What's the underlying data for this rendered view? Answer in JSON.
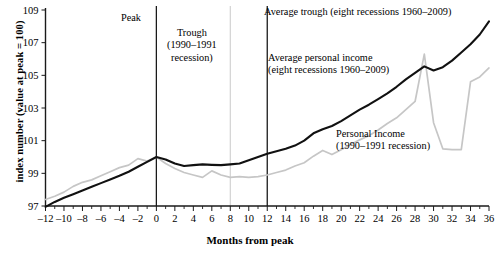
{
  "chart_data": {
    "type": "line",
    "title": "",
    "xlabel": "Months from peak",
    "ylabel": "index number (value at peak = 100)",
    "xlim": [
      -12,
      36
    ],
    "ylim": [
      97,
      109
    ],
    "grid": false,
    "legend_position": "inline-annotations",
    "x_ticks": [
      -12,
      -10,
      -8,
      -6,
      -4,
      -2,
      0,
      2,
      4,
      6,
      8,
      10,
      12,
      14,
      16,
      18,
      20,
      22,
      24,
      26,
      28,
      30,
      32,
      34,
      36
    ],
    "x_tick_labels": [
      "–12",
      "–10",
      "–8",
      "–6",
      "–4",
      "–2",
      "0",
      "2",
      "4",
      "6",
      "8",
      "10",
      "12",
      "14",
      "16",
      "18",
      "20",
      "22",
      "24",
      "26",
      "28",
      "30",
      "32",
      "34",
      "36"
    ],
    "y_ticks": [
      97,
      99,
      101,
      103,
      105,
      107,
      109
    ],
    "y_tick_labels": [
      "97",
      "99",
      "101",
      "103",
      "105",
      "107",
      "109"
    ],
    "x": [
      -12,
      -11,
      -10,
      -9,
      -8,
      -7,
      -6,
      -5,
      -4,
      -3,
      -2,
      -1,
      0,
      1,
      2,
      3,
      4,
      5,
      6,
      7,
      8,
      9,
      10,
      11,
      12,
      13,
      14,
      15,
      16,
      17,
      18,
      19,
      20,
      21,
      22,
      23,
      24,
      25,
      26,
      27,
      28,
      29,
      30,
      31,
      32,
      33,
      34,
      35,
      36
    ],
    "series": [
      {
        "name": "Average personal income (eight recessions 1960–2009)",
        "color": "#111111",
        "values": [
          96.95,
          97.25,
          97.5,
          97.72,
          97.95,
          98.18,
          98.4,
          98.62,
          98.85,
          99.1,
          99.4,
          99.7,
          100.0,
          99.85,
          99.6,
          99.45,
          99.5,
          99.55,
          99.52,
          99.5,
          99.55,
          99.6,
          99.8,
          100.0,
          100.2,
          100.35,
          100.5,
          100.7,
          101.0,
          101.45,
          101.7,
          101.9,
          102.2,
          102.55,
          102.9,
          103.2,
          103.55,
          103.9,
          104.3,
          104.75,
          105.15,
          105.55,
          105.3,
          105.5,
          105.9,
          106.4,
          106.9,
          107.5,
          108.3
        ]
      },
      {
        "name": "Personal Income (1990–1991 recession)",
        "color": "#c6c6c6",
        "values": [
          97.4,
          97.6,
          97.85,
          98.2,
          98.45,
          98.6,
          98.85,
          99.1,
          99.35,
          99.5,
          99.9,
          99.75,
          100.0,
          99.6,
          99.3,
          99.05,
          98.9,
          98.75,
          99.15,
          98.9,
          98.75,
          98.8,
          98.75,
          98.8,
          98.9,
          99.05,
          99.2,
          99.45,
          99.65,
          100.05,
          100.4,
          100.15,
          100.45,
          100.75,
          101.05,
          101.3,
          101.65,
          102.05,
          102.4,
          102.9,
          103.4,
          106.3,
          102.1,
          100.5,
          100.45,
          100.45,
          104.6,
          104.9,
          105.45
        ]
      }
    ],
    "reference_lines": [
      {
        "name": "peak",
        "x": 0,
        "style": "dark",
        "label": "Peak"
      },
      {
        "name": "trough-1990-1991",
        "x": 8,
        "style": "light",
        "label": "Trough\n(1990–1991\nrecession)"
      },
      {
        "name": "average-trough",
        "x": 12,
        "style": "dark",
        "label": "Average trough (eight recessions 1960–2009)"
      }
    ],
    "annotations": [
      {
        "name": "peak",
        "text": "Peak"
      },
      {
        "name": "trough",
        "text": "Trough\n(1990–1991\nrecession)"
      },
      {
        "name": "average-trough",
        "text": "Average trough (eight recessions 1960–2009)"
      },
      {
        "name": "average-personal-income",
        "text": "Average personal income\n(eight recessions 1960–2009)"
      },
      {
        "name": "personal-income",
        "text": "Personal Income\n(1990–1991 recession)"
      }
    ]
  },
  "labels": {
    "y_axis_title": "index number (value at peak = 100)",
    "x_axis_title": "Months from peak",
    "annot_peak": "Peak",
    "annot_trough": "Trough\n(1990–1991\nrecession)",
    "annot_avg_trough": "Average trough (eight recessions 1960–2009)",
    "annot_avg_income": "Average personal income\n(eight recessions 1960–2009)",
    "annot_personal_income": "Personal Income\n(1990–1991 recession)"
  },
  "colors": {
    "series_average": "#111111",
    "series_1990": "#c6c6c6",
    "axis": "#1a1a1a",
    "reference_light": "#cfcfcf",
    "background": "#ffffff"
  }
}
